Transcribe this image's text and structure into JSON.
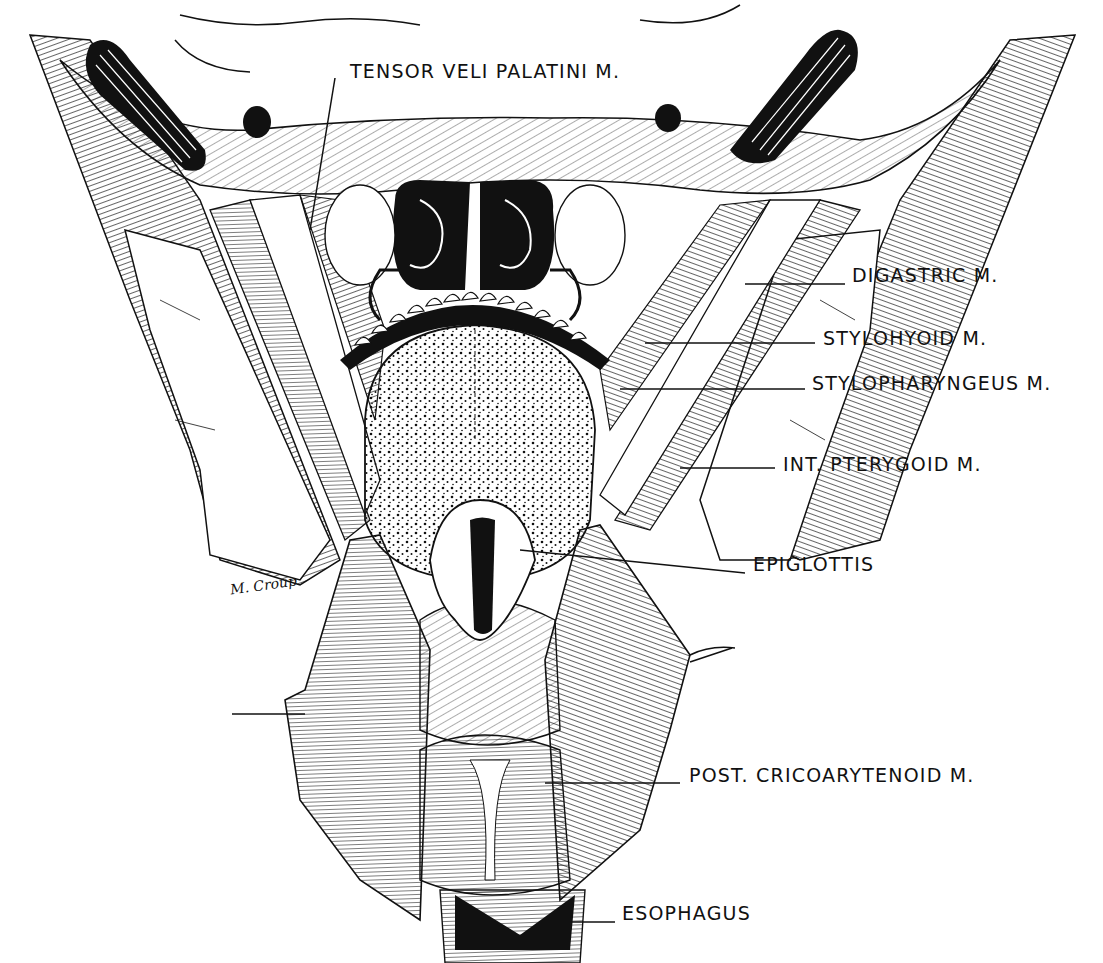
{
  "figure": {
    "type": "anatomical-illustration",
    "view": "posterior view of pharynx (opened) showing tongue, epiglottis and larynx",
    "style": "black-and-white pen hatching",
    "colors": {
      "ink": "#111111",
      "paper": "#ffffff"
    }
  },
  "labels": [
    {
      "id": "tensor-veli-palatini",
      "text": "TENSOR VELI PALATINI M.",
      "x": 350,
      "y": 62
    },
    {
      "id": "digastric",
      "text": "DIGASTRIC M.",
      "x": 852,
      "y": 266
    },
    {
      "id": "stylohyoid",
      "text": "STYLOHYOID M.",
      "x": 823,
      "y": 329
    },
    {
      "id": "stylopharyngeus",
      "text": "STYLOPHARYNGEUS M.",
      "x": 812,
      "y": 374
    },
    {
      "id": "int-pterygoid",
      "text": "INT. PTERYGOID M.",
      "x": 783,
      "y": 455
    },
    {
      "id": "epiglottis",
      "text": "EPIGLOTTIS",
      "x": 753,
      "y": 555
    },
    {
      "id": "post-cricoarytenoid",
      "text": "POST. CRICOARYTENOID M.",
      "x": 689,
      "y": 766
    },
    {
      "id": "esophagus",
      "text": "ESOPHAGUS",
      "x": 622,
      "y": 904
    }
  ],
  "signature": {
    "text": "M. Croup"
  }
}
